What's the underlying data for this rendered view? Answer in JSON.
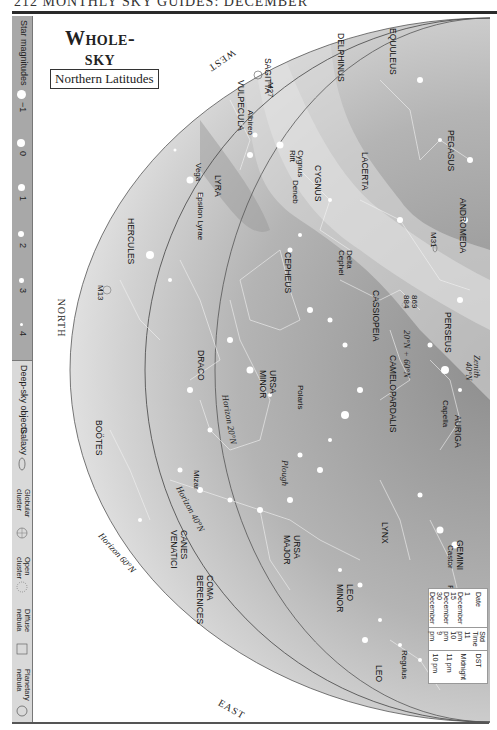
{
  "page": {
    "running_head": "212   MONTHLY SKY GUIDES: DECEMBER",
    "title_line1": "Whole-sky",
    "title_line2": "Chart",
    "subtitle": "Northern Latitudes"
  },
  "legend": {
    "magnitudes_title": "Star magnitudes",
    "magnitudes": [
      {
        "label": "−1",
        "size": 9
      },
      {
        "label": "0",
        "size": 8
      },
      {
        "label": "1",
        "size": 7
      },
      {
        "label": "2",
        "size": 6
      },
      {
        "label": "3",
        "size": 4.5
      },
      {
        "label": "4",
        "size": 3
      },
      {
        "label": "5",
        "size": 1.5
      }
    ],
    "deep_sky_title": "Deep-sky objects",
    "deep_sky": [
      {
        "label": "Galaxy",
        "icon": "galaxy-icon"
      },
      {
        "label": "Globular cluster",
        "icon": "globular-cluster-icon"
      },
      {
        "label": "Open cluster",
        "icon": "open-cluster-icon"
      },
      {
        "label": "Diffuse nebula",
        "icon": "diffuse-nebula-icon"
      },
      {
        "label": "Planetary nebula",
        "icon": "planetary-nebula-icon"
      }
    ]
  },
  "directions": {
    "west": "WEST",
    "north": "NORTH",
    "east": "EAST"
  },
  "horizons": {
    "h20": "Horizon 20°N",
    "h40": "Horizon 40°N",
    "h60": "Horizon 60°N",
    "zenith": "Zenith",
    "zenith_40": "40°N",
    "zenith_20_60": "20°N",
    "zenith_60": "60°N",
    "ecliptic": "Ecliptic"
  },
  "constellations": [
    "EQUULEUS",
    "DELPHINUS",
    "SAGITTA",
    "VULPECULA",
    "PEGASUS",
    "CYGNUS",
    "LACERTA",
    "LYRA",
    "HERCULES",
    "ANDROMEDA",
    "CEPHEUS",
    "CASSIOPEIA",
    "PERSEUS",
    "CAMELOPARDALIS",
    "AURIGA",
    "URSA MINOR",
    "DRACO",
    "URSA MAJOR",
    "LYNX",
    "GEMINI",
    "BOÖTES",
    "CANES VENATICI",
    "COMA BERENICES",
    "LEO MINOR",
    "CANCER",
    "LEO"
  ],
  "stars_and_objects": [
    "M27",
    "Albireo",
    "Cygnus Rift",
    "Deneb",
    "Vega",
    "Epsilon Lyrae",
    "M13",
    "Delta Cephei",
    "M31",
    "869",
    "884",
    "Polaris",
    "Capella",
    "Plough",
    "Mizar",
    "Castor",
    "Pollux",
    "M44",
    "Regulus"
  ],
  "time_table": {
    "headers": [
      "Date",
      "Std Time",
      "DST"
    ],
    "rows": [
      [
        "1 December",
        "11 pm",
        "Midnight"
      ],
      [
        "15 December",
        "10 pm",
        "11 pm"
      ],
      [
        "30 December",
        "9 pm",
        "10 pm"
      ]
    ]
  },
  "colors": {
    "sky_outer": "#efefef",
    "sky_mid": "#c8c8c8",
    "sky_inner": "#9c9c9c",
    "milky_way": "#d8d8d8",
    "sidebar": "#a8a8a8"
  }
}
